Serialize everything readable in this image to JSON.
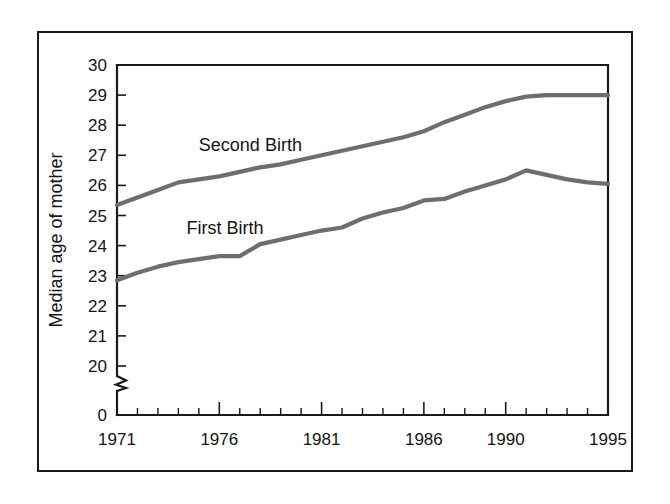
{
  "figure": {
    "frame_color": "#1a1a1a",
    "background": "#ffffff"
  },
  "chart_data": {
    "type": "line",
    "title": "",
    "subtitle": "",
    "xlabel": "",
    "ylabel": "Median age of mother",
    "x": [
      1971,
      1972,
      1973,
      1974,
      1975,
      1976,
      1977,
      1978,
      1979,
      1980,
      1981,
      1982,
      1983,
      1984,
      1985,
      1986,
      1987,
      1988,
      1989,
      1990,
      1991,
      1992,
      1993,
      1994,
      1995
    ],
    "xlim": [
      1971,
      1995
    ],
    "ylim": [
      20,
      30
    ],
    "y_axis_break": true,
    "y_axis_break_label": "0",
    "grid": false,
    "legend_position": "inline-annotation",
    "x_tick_labels": [
      "1971",
      "1976",
      "1981",
      "1986",
      "1990",
      "1995"
    ],
    "x_tick_label_values": [
      1971,
      1976,
      1981,
      1986,
      1990,
      1995
    ],
    "x_minor_tick_interval": 1,
    "y_tick_labels": [
      "30",
      "29",
      "28",
      "27",
      "26",
      "25",
      "24",
      "23",
      "22",
      "21",
      "20",
      "0"
    ],
    "y_tick_values": [
      30,
      29,
      28,
      27,
      26,
      25,
      24,
      23,
      22,
      21,
      20
    ],
    "series": [
      {
        "name": "Second Birth",
        "label": "Second Birth",
        "color": "#6e6e6e",
        "label_x": 1975.0,
        "label_y": 27.15,
        "values": [
          25.35,
          25.6,
          25.85,
          26.1,
          26.2,
          26.3,
          26.45,
          26.6,
          26.7,
          26.85,
          27.0,
          27.15,
          27.3,
          27.45,
          27.6,
          27.8,
          28.1,
          28.35,
          28.6,
          28.8,
          28.95,
          29.0,
          29.0,
          29.0,
          29.0
        ]
      },
      {
        "name": "First Birth",
        "label": "First Birth",
        "color": "#6e6e6e",
        "label_x": 1974.4,
        "label_y": 24.4,
        "values": [
          22.85,
          23.1,
          23.3,
          23.45,
          23.55,
          23.65,
          23.65,
          24.05,
          24.2,
          24.35,
          24.5,
          24.6,
          24.9,
          25.1,
          25.25,
          25.5,
          25.55,
          25.8,
          26.0,
          26.2,
          26.5,
          26.35,
          26.2,
          26.1,
          26.05
        ]
      }
    ]
  },
  "geometry": {
    "plot_left_px": 117,
    "plot_right_px": 608,
    "plot_top_px": 65,
    "y_value_top": 30,
    "y_value_bottom": 20,
    "y_bottom_px": 366,
    "zero_tick_px": 415
  }
}
